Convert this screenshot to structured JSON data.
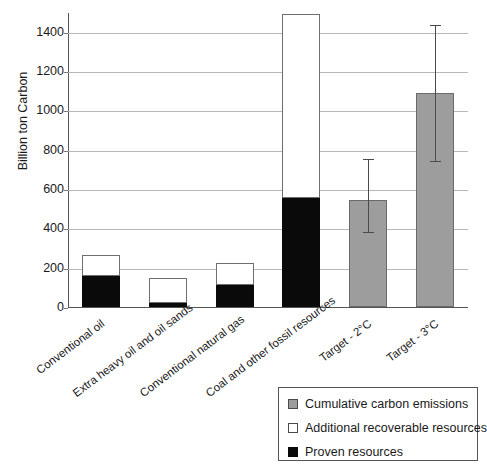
{
  "chart_data": {
    "type": "bar",
    "title": "",
    "subtitle": "",
    "xlabel": "",
    "ylabel": "Billion ton Carbon",
    "ylim": [
      0,
      1500
    ],
    "yticks": [
      0,
      200,
      400,
      600,
      800,
      1000,
      1200,
      1400
    ],
    "ytick_labels": [
      "0",
      "200",
      "400",
      "600",
      "800",
      "1000",
      "1200",
      "1400"
    ],
    "grid": true,
    "grid_axis": "y",
    "legend_position": "bottom-right",
    "stacked": true,
    "categories": [
      "Conventional oil",
      "Extra heavy oil and oil sands",
      "Conventional natural gas",
      "Coal and other fossil resources",
      "Target - 2°C",
      "Target - 3°C"
    ],
    "series": [
      {
        "name": "Proven resources",
        "color": "#0a0a0a",
        "values": [
          160,
          20,
          110,
          555,
          null,
          null
        ]
      },
      {
        "name": "Additional recoverable resources",
        "color": "#ffffff",
        "values": [
          105,
          130,
          115,
          935,
          null,
          null
        ]
      },
      {
        "name": "Cumulative carbon emissions",
        "color": "#9d9d9d",
        "values": [
          null,
          null,
          null,
          null,
          545,
          1090
        ]
      }
    ],
    "totals": [
      265,
      150,
      225,
      1490,
      545,
      1090
    ],
    "error_bars": [
      null,
      null,
      null,
      null,
      {
        "value": 545,
        "low": 385,
        "high": 760
      },
      {
        "value": 1090,
        "low": 745,
        "high": 1440
      }
    ],
    "annotations": []
  },
  "legend": {
    "entries": [
      {
        "label": "Cumulative carbon emissions",
        "swatch": "gray"
      },
      {
        "label": "Additional recoverable resources",
        "swatch": "white"
      },
      {
        "label": "Proven resources",
        "swatch": "black"
      }
    ]
  },
  "colors": {
    "proven": "#0a0a0a",
    "additional": "#ffffff",
    "emissions": "#9d9d9d",
    "axis": "#555555",
    "grid": "#b8b8b8",
    "background": "#ffffff"
  }
}
